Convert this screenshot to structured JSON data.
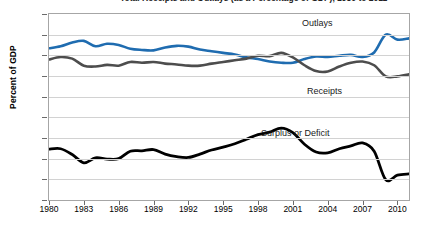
{
  "figure": {
    "title_clipped": "Total Receipts and Outlays (as a Percentage of GDP), 1980 to 2011"
  },
  "axes": {
    "ylabel": "Percent of GDP",
    "xlabel": "",
    "yticks": [
      "30",
      "25",
      "20",
      "15",
      "10",
      "5",
      "0",
      "-5",
      "-10",
      "-15"
    ],
    "xticks": [
      "1980",
      "1983",
      "1986",
      "1989",
      "1992",
      "1995",
      "1998",
      "2001",
      "2004",
      "2007",
      "2010"
    ]
  },
  "annotations": {
    "outlays": "Outlays",
    "receipts": "Receipts",
    "deficit": "Surplus or Deficit"
  },
  "colors": {
    "outlays": "#1f6cb0",
    "receipts": "#4d4d4d",
    "deficit": "#000000",
    "grid": "#d2d2d2",
    "frame": "#a6a6a6"
  },
  "chart_data": {
    "type": "line",
    "title": "Total Receipts and Outlays (as a Percentage of GDP), 1980 to 2011",
    "xlabel": "",
    "ylabel": "Percent of GDP",
    "xlim": [
      1980,
      2011
    ],
    "ylim": [
      -15,
      30
    ],
    "ytick_step": 5,
    "xtick_step": 3,
    "grid": true,
    "legend": "inline-annotations",
    "x": [
      1980,
      1981,
      1982,
      1983,
      1984,
      1985,
      1986,
      1987,
      1988,
      1989,
      1990,
      1991,
      1992,
      1993,
      1994,
      1995,
      1996,
      1997,
      1998,
      1999,
      2000,
      2001,
      2002,
      2003,
      2004,
      2005,
      2006,
      2007,
      2008,
      2009,
      2010,
      2011
    ],
    "series": [
      {
        "name": "Outlays",
        "color": "#1f6cb0",
        "values": [
          21.7,
          22.2,
          23.1,
          23.5,
          22.2,
          22.8,
          22.5,
          21.6,
          21.3,
          21.2,
          21.9,
          22.3,
          22.1,
          21.4,
          21.0,
          20.6,
          20.2,
          19.5,
          19.1,
          18.5,
          18.2,
          18.2,
          19.1,
          19.7,
          19.6,
          19.9,
          20.1,
          19.6,
          20.7,
          25.0,
          23.8,
          24.1
        ]
      },
      {
        "name": "Receipts",
        "color": "#4d4d4d",
        "values": [
          19.0,
          19.6,
          19.2,
          17.5,
          17.3,
          17.7,
          17.5,
          18.4,
          18.2,
          18.4,
          18.0,
          17.8,
          17.5,
          17.5,
          18.0,
          18.4,
          18.8,
          19.2,
          19.9,
          19.8,
          20.6,
          19.5,
          17.6,
          16.2,
          16.1,
          17.3,
          18.2,
          18.5,
          17.6,
          14.9,
          14.9,
          15.4
        ]
      },
      {
        "name": "Surplus or Deficit",
        "color": "#000000",
        "values": [
          -2.7,
          -2.6,
          -4.0,
          -6.0,
          -4.8,
          -5.1,
          -5.0,
          -3.2,
          -3.1,
          -2.8,
          -3.9,
          -4.5,
          -4.7,
          -3.9,
          -2.9,
          -2.2,
          -1.4,
          -0.3,
          0.8,
          1.4,
          2.4,
          1.3,
          -1.5,
          -3.4,
          -3.6,
          -2.6,
          -1.9,
          -1.2,
          -3.2,
          -10.1,
          -9.0,
          -8.7
        ]
      }
    ]
  }
}
